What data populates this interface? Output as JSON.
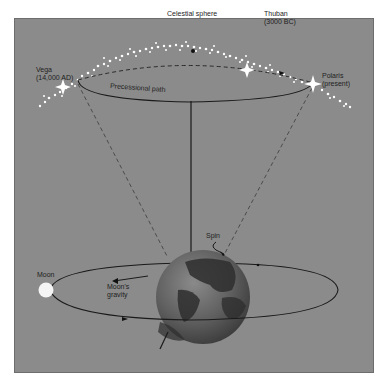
{
  "diagram": {
    "labels": {
      "celestial_sphere": "Celestial sphere",
      "vega_name": "Vega",
      "vega_date": "(14,000 AD)",
      "thuban_name": "Thuban",
      "thuban_date": "(3000 BC)",
      "polaris_name": "Polaris",
      "polaris_date": "(present)",
      "precessional_path": "Precessional path",
      "spin": "Spin",
      "moon": "Moon",
      "moons_gravity_1": "Moon's",
      "moons_gravity_2": "gravity"
    },
    "colors": {
      "background": "#8b8b8b",
      "line": "#1a1a1a",
      "dashed": "#4a4a4a",
      "stars": "#ffffff",
      "moon": "#f4f4f4"
    }
  }
}
